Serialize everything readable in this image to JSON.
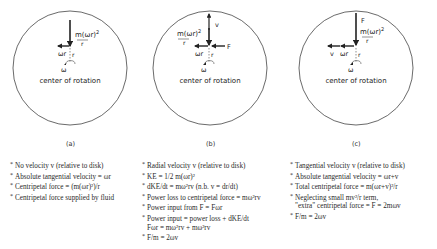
{
  "panels": [
    {
      "id": "a",
      "caption": "(a)",
      "center_label": "center of rotation",
      "labels": {
        "force": "m(ωr)²",
        "force_num": "m(ωr)",
        "force_exp": "2",
        "force_den": "r",
        "tangential": "ωr",
        "radius": "r",
        "omega": "ω"
      },
      "notes": [
        {
          "text": "No velocity v (relative to disk)",
          "bullet": true
        },
        {
          "text": "Absolute tangential velocity = ωr",
          "bullet": true
        },
        {
          "text": "Centripetal force = (m(ωr)²)/r",
          "bullet": true
        },
        {
          "text": "Centripetal force supplied by fluid",
          "bullet": true
        }
      ]
    },
    {
      "id": "b",
      "caption": "(b)",
      "center_label": "center of rotation",
      "labels": {
        "force_num": "m(ωr)",
        "force_exp": "2",
        "force_den": "r",
        "tangential": "ωr",
        "radius": "r",
        "omega": "ω",
        "radial_velocity": "v",
        "applied_force": "F"
      },
      "notes": [
        {
          "text": "Radial velocity v (relative to disk)",
          "bullet": true
        },
        {
          "text": "KE = 1/2 m(ωr)²",
          "bullet": true
        },
        {
          "text": "dKE/dt = mω²rv   (n.b. v = dr/dt)",
          "bullet": true
        },
        {
          "text": "Power loss to centripetal force = mω²rv",
          "bullet": true
        },
        {
          "text": "Power input from F = Fωr",
          "bullet": true
        },
        {
          "text": "Power input = power loss + dKE/dt",
          "bullet": true
        },
        {
          "text": "Fωr = mω²rv + mω²rv",
          "bullet": false
        },
        {
          "text": "F/m = 2ωv",
          "bullet": true
        }
      ]
    },
    {
      "id": "c",
      "caption": "(c)",
      "center_label": "center of rotation",
      "labels": {
        "force_num": "m(ωr)",
        "force_exp": "2",
        "force_den": "r",
        "tangential": "ωr",
        "radius": "r",
        "omega": "ω",
        "tangential_velocity": "v",
        "applied_force": "F"
      },
      "notes": [
        {
          "text": "Tangential velocity v (relative to disk)",
          "bullet": true
        },
        {
          "text": "Absolute tangential velocity = ωr+v",
          "bullet": true
        },
        {
          "text": "Total centripetal force = m(ωr+v)²/r",
          "bullet": true
        },
        {
          "text": "Neglecting small mv²/r term,",
          "bullet": true
        },
        {
          "text": "\"extra\" centripetal force = F = 2mωv",
          "bullet": false
        },
        {
          "text": "F/m = 2ωv",
          "bullet": true
        }
      ]
    }
  ],
  "colors": {
    "line": "#333333",
    "text": "#222222",
    "background": "#ffffff"
  }
}
